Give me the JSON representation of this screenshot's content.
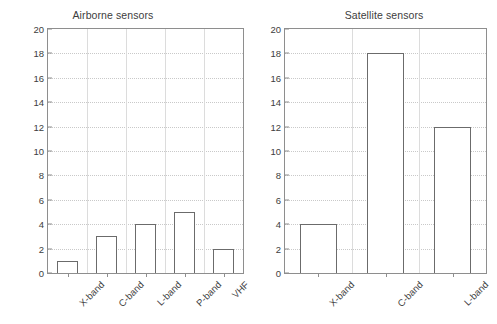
{
  "chart_data": [
    {
      "type": "bar",
      "title": "Airborne sensors",
      "categories": [
        "X-band",
        "C-band",
        "L-band",
        "P-band",
        "VHF"
      ],
      "values": [
        1,
        3,
        4,
        5,
        2
      ],
      "xlabel": "",
      "ylabel": "Number of studies",
      "ylim": [
        0,
        20
      ],
      "ytick_labels": [
        "0",
        "2",
        "4",
        "6",
        "8",
        "10",
        "12",
        "14",
        "16",
        "18",
        "20"
      ],
      "ytick_values": [
        0,
        2,
        4,
        6,
        8,
        10,
        12,
        14,
        16,
        18,
        20
      ],
      "grid": true,
      "legend": "none",
      "bar_fill": "#ffffff",
      "bar_edge": "#6b6b6b",
      "grid_color": "#c9c9c9",
      "axis_color": "#8e8e8e"
    },
    {
      "type": "bar",
      "title": "Satellite sensors",
      "categories": [
        "X-band",
        "C-band",
        "L-band"
      ],
      "values": [
        4,
        18,
        12
      ],
      "xlabel": "",
      "ylabel": "",
      "ylim": [
        0,
        20
      ],
      "ytick_labels": [
        "0",
        "2",
        "4",
        "6",
        "8",
        "10",
        "12",
        "14",
        "16",
        "18",
        "20"
      ],
      "ytick_values": [
        0,
        2,
        4,
        6,
        8,
        10,
        12,
        14,
        16,
        18,
        20
      ],
      "grid": true,
      "legend": "none",
      "bar_fill": "#ffffff",
      "bar_edge": "#6b6b6b",
      "grid_color": "#c9c9c9",
      "axis_color": "#8e8e8e"
    }
  ]
}
